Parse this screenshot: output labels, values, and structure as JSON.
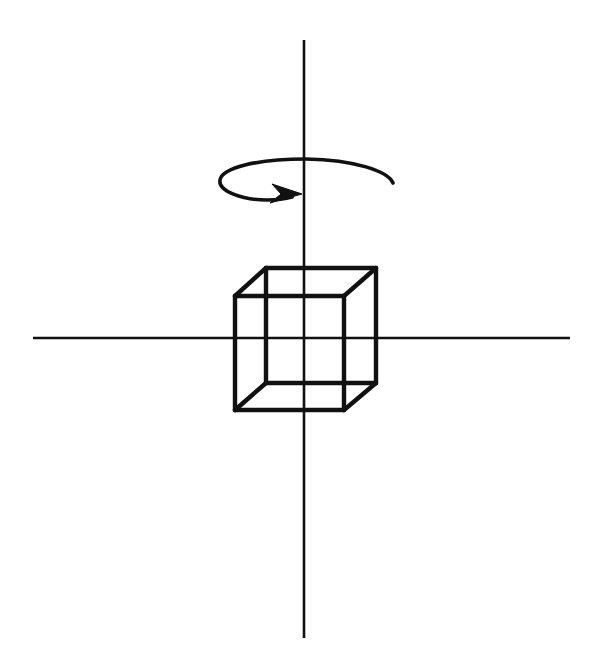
{
  "figure": {
    "title": "Wireframe cube rotating about a vertical axis",
    "description": "A transparent wireframe cube centered on the origin of a two-line coordinate cross, with a curved arrow encircling the vertical axis above the cube to indicate rotation.",
    "background_color": "#ffffff",
    "ink_color": "#111111",
    "width": 605,
    "height": 656
  },
  "axes": {
    "vertical": {
      "label": "vertical-rotation-axis",
      "x": 304,
      "y_top": 40,
      "y_bottom": 638,
      "stroke_width": 2.6
    },
    "horizontal": {
      "label": "horizontal-axis",
      "y": 338,
      "x_left": 33,
      "x_right": 570,
      "stroke_width": 2.6
    },
    "origin": {
      "x": 304,
      "y": 338
    }
  },
  "cube": {
    "label": "wireframe-cube",
    "stroke_width": 4.4,
    "projection": "oblique",
    "front_face": {
      "label": "front-face",
      "top_left": {
        "x": 235,
        "y": 296
      },
      "top_right": {
        "x": 344,
        "y": 296
      },
      "bottom_right": {
        "x": 344,
        "y": 410
      },
      "bottom_left": {
        "x": 235,
        "y": 410
      }
    },
    "back_face": {
      "label": "back-face",
      "top_left": {
        "x": 266,
        "y": 268
      },
      "top_right": {
        "x": 376,
        "y": 268
      },
      "bottom_right": {
        "x": 376,
        "y": 383
      },
      "bottom_left": {
        "x": 266,
        "y": 383
      }
    },
    "connector_offset": {
      "dx": 31,
      "dy": -28
    },
    "edge_count": 12
  },
  "rotation_arrow": {
    "label": "rotation-direction-arrow",
    "sense": "clockwise-viewed-from-above",
    "ellipse_center": {
      "x": 306,
      "y": 180
    },
    "ellipse_radius_x": 87,
    "ellipse_radius_y": 20,
    "arc_start": {
      "x": 393,
      "y": 183
    },
    "arc_end": {
      "x": 283,
      "y": 197
    },
    "arrow_tip": {
      "x": 299,
      "y": 194
    },
    "stroke_width": 3.6
  }
}
